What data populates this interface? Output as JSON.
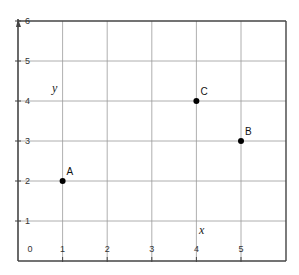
{
  "chart_data": {
    "type": "scatter",
    "title": "",
    "xlabel": "x",
    "ylabel": "y",
    "xlim": [
      0,
      6
    ],
    "ylim": [
      0,
      6
    ],
    "grid": true,
    "x_ticks": [
      "0",
      "1",
      "2",
      "3",
      "4",
      "5"
    ],
    "y_ticks": [
      "1",
      "2",
      "3",
      "4",
      "5",
      "6"
    ],
    "points": [
      {
        "label": "A",
        "x": 1,
        "y": 2
      },
      {
        "label": "B",
        "x": 5,
        "y": 3
      },
      {
        "label": "C",
        "x": 4,
        "y": 4
      }
    ],
    "colors": {
      "grid": "#9a9a9a",
      "frame": "#444444",
      "point": "#000000"
    }
  }
}
